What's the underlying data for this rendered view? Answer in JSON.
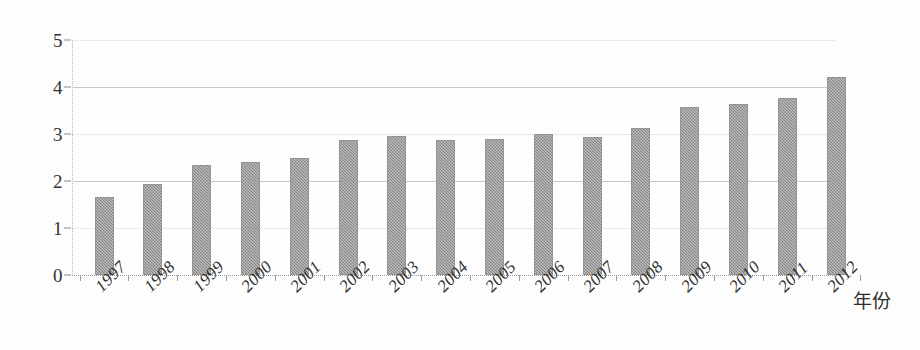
{
  "chart_data": {
    "type": "bar",
    "title": "",
    "subtitle": "",
    "xlabel": "年份",
    "ylabel": "",
    "categories": [
      "1997",
      "1998",
      "1999",
      "2000",
      "2001",
      "2002",
      "2003",
      "2004",
      "2005",
      "2006",
      "2007",
      "2008",
      "2009",
      "2010",
      "2011",
      "2012"
    ],
    "values": [
      1.66,
      1.94,
      2.34,
      2.4,
      2.49,
      2.87,
      2.96,
      2.87,
      2.89,
      3.0,
      2.94,
      3.13,
      3.57,
      3.64,
      3.77,
      4.21
    ],
    "series": [
      {
        "name": "",
        "values": [
          1.66,
          1.94,
          2.34,
          2.4,
          2.49,
          2.87,
          2.96,
          2.87,
          2.89,
          3.0,
          2.94,
          3.13,
          3.57,
          3.64,
          3.77,
          4.21
        ]
      }
    ],
    "ylim": [
      0,
      5
    ],
    "y_ticks": [
      0,
      1,
      2,
      3,
      4,
      5
    ],
    "y_tick_labels": [
      "0",
      "1",
      "2",
      "3",
      "4",
      "5"
    ],
    "grid": true,
    "legend": false,
    "legend_position": "none",
    "bar_color": "#8d8d8d",
    "gridline_color": "#c9c9c9",
    "axis_color": "#8f8f8f",
    "annotations": []
  },
  "axis_title": {
    "x": "年份"
  }
}
